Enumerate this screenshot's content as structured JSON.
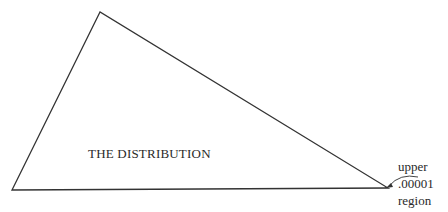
{
  "diagram": {
    "shape": "triangle",
    "vertices": [
      [
        100,
        12
      ],
      [
        12,
        190
      ],
      [
        388,
        188
      ]
    ],
    "stroke_color": "#333333",
    "main_label": "THE DISTRIBUTION",
    "annotation": {
      "lines": [
        "upper",
        ".00001",
        "region"
      ],
      "arrow_target": "right-vertex"
    }
  }
}
